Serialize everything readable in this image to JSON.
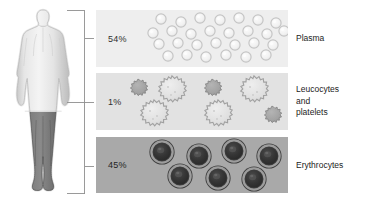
{
  "diagram": {
    "figure": {
      "name": "human-body-silhouette",
      "upper_body_shade": "#e3e3e3",
      "lower_body_shade": "#6e6e6e"
    },
    "bracket": {
      "name": "grouping-bracket",
      "color": "#8a8a8a"
    },
    "bands": [
      {
        "id": "plasma",
        "percent": "54%",
        "label": "Plasma",
        "band_color": "#eeeeee",
        "cell_type": "plasma-droplets",
        "cell_outline": "#c3c3c3",
        "cell_fill": "#f3f3f3",
        "cell_count": 26
      },
      {
        "id": "leucocytes",
        "percent": "1%",
        "label": "Leucocytes\nand\nplatelets",
        "band_color": "#e2e2e2",
        "cell_type": "spiky-leucocytes",
        "cell_outline": "#9a9a9a",
        "cell_fill": "#dcdcdc",
        "platelet_fill": "#9d9d9d",
        "cell_count": 7
      },
      {
        "id": "erythrocytes",
        "percent": "45%",
        "label": "Erythrocytes",
        "band_color": "#a9a9a9",
        "cell_type": "biconcave-erythrocytes",
        "cell_outline": "#3a3a3a",
        "cell_fill": "#2e2e2e",
        "cell_ring": "#8f8f8f",
        "cell_count": 7
      }
    ]
  }
}
